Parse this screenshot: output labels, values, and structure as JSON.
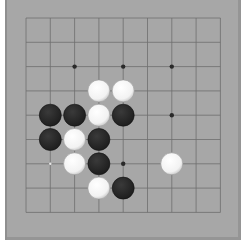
{
  "board": {
    "size": 9,
    "origin": {
      "x": 26,
      "y": 18
    },
    "spacing": 24.3,
    "colors": {
      "background": "#a7a7a7",
      "line": "#6e6e6e",
      "black_stone": "#1e1e1e",
      "white_stone": "#f2f2f2",
      "star": "#2a2a2a"
    },
    "star_points": [
      [
        2,
        2
      ],
      [
        4,
        2
      ],
      [
        6,
        2
      ],
      [
        6,
        4
      ],
      [
        4,
        6
      ]
    ],
    "markers": [
      {
        "col": 1,
        "row": 6,
        "type": "small-dot"
      }
    ],
    "stones": [
      {
        "col": 3,
        "row": 3,
        "color": "white"
      },
      {
        "col": 4,
        "row": 3,
        "color": "white"
      },
      {
        "col": 1,
        "row": 4,
        "color": "black"
      },
      {
        "col": 2,
        "row": 4,
        "color": "black"
      },
      {
        "col": 3,
        "row": 4,
        "color": "white"
      },
      {
        "col": 4,
        "row": 4,
        "color": "black"
      },
      {
        "col": 1,
        "row": 5,
        "color": "black"
      },
      {
        "col": 2,
        "row": 5,
        "color": "white"
      },
      {
        "col": 3,
        "row": 5,
        "color": "black"
      },
      {
        "col": 2,
        "row": 6,
        "color": "white"
      },
      {
        "col": 3,
        "row": 6,
        "color": "black"
      },
      {
        "col": 6,
        "row": 6,
        "color": "white"
      },
      {
        "col": 3,
        "row": 7,
        "color": "white"
      },
      {
        "col": 4,
        "row": 7,
        "color": "black"
      }
    ]
  }
}
